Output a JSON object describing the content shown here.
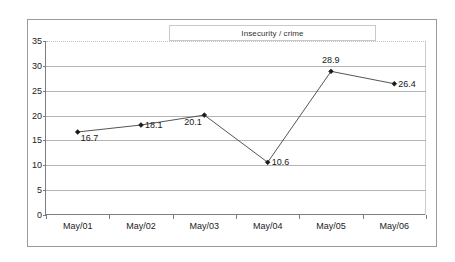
{
  "chart_data": {
    "type": "line",
    "title": "Insecurity / crime",
    "xlabel": "",
    "ylabel": "",
    "categories": [
      "May/01",
      "May/02",
      "May/03",
      "May/04",
      "May/05",
      "May/06"
    ],
    "values": [
      16.7,
      18.1,
      20.1,
      10.6,
      28.9,
      26.4
    ],
    "point_labels": [
      "16.7",
      "18.1",
      "20.1",
      "10.6",
      "28.9",
      "26.4"
    ],
    "ylim": [
      0,
      35
    ],
    "ytick_labels": [
      "0",
      "5",
      "10",
      "15",
      "20",
      "25",
      "30",
      "35"
    ],
    "ytick_values": [
      0,
      5,
      10,
      15,
      20,
      25,
      30,
      35
    ],
    "grid": "horizontal",
    "legend": "none",
    "series": [
      {
        "name": "Insecurity / crime",
        "values": [
          16.7,
          18.1,
          20.1,
          10.6,
          28.9,
          26.4
        ]
      }
    ],
    "colors": {
      "line": "#555555",
      "marker": "#1a1a1a",
      "gridline": "#b4b4b4",
      "axis": "#7d7d7d",
      "frame": "#9a9a9a",
      "background": "#ffffff",
      "text": "#222222"
    },
    "label_placement": [
      "below-right",
      "right",
      "below-left",
      "right",
      "above",
      "right"
    ]
  }
}
